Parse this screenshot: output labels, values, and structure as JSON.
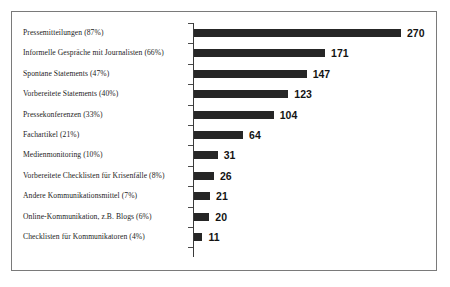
{
  "chart_data": {
    "type": "bar",
    "orientation": "horizontal",
    "title": "",
    "subtitle": "",
    "xlabel": "",
    "ylabel": "",
    "grid": false,
    "legend": false,
    "xlim": [
      0,
      270
    ],
    "categories": [
      "Pressemitteilungen (87%)",
      "Informelle Gespräche mit Journalisten (66%)",
      "Spontane Statements (47%)",
      "Vorbereitete Statements (40%)",
      "Pressekonferenzen (33%)",
      "Fachartikel (21%)",
      "Medienmonitoring (10%)",
      "Vorbereitete Checklisten für Krisenfälle (8%)",
      "Andere Kommunikationsmittel (7%)",
      "Online-Kommunikation, z.B. Blogs (6%)",
      "Checklisten für Kommunikatoren (4%)"
    ],
    "values": [
      270,
      171,
      147,
      123,
      104,
      64,
      31,
      26,
      21,
      20,
      11
    ],
    "percentages": [
      87,
      66,
      47,
      40,
      33,
      21,
      10,
      8,
      7,
      6,
      4
    ],
    "value_labels": [
      "270",
      "171",
      "147",
      "123",
      "104",
      "64",
      "31",
      "26",
      "21",
      "20",
      "11"
    ],
    "bar_color": "#262626",
    "background_color": "#ffffff",
    "border_color": "#7a7a7a",
    "axis_color": "#3a3a3a"
  }
}
